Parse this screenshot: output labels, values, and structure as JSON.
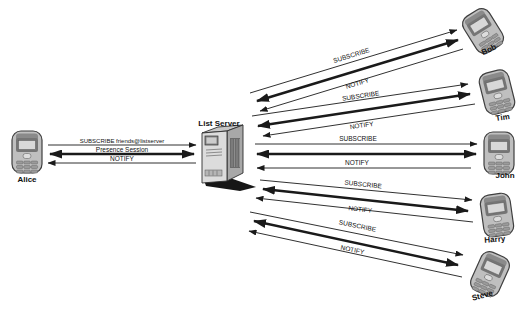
{
  "diagram": {
    "background": "#ffffff",
    "line_color": "#1a1a1a",
    "nodes": {
      "alice": {
        "label": "Alice"
      },
      "server": {
        "label": "List Server"
      },
      "bob": {
        "label": "Bob"
      },
      "tim": {
        "label": "Tim"
      },
      "john": {
        "label": "John"
      },
      "harry": {
        "label": "Harry"
      },
      "steve": {
        "label": "Steve"
      }
    },
    "links": {
      "alice": {
        "subscribe": "SUBSCRIBE friends@listserver",
        "session": "Presence Session",
        "notify": "NOTIFY"
      },
      "bob": {
        "subscribe": "SUBSCRIBE",
        "notify": "NOTIFY"
      },
      "tim": {
        "subscribe": "SUBSCRIBE",
        "notify": "NOTIFY"
      },
      "john": {
        "subscribe": "SUBSCRIBE",
        "notify": "NOTIFY"
      },
      "harry": {
        "subscribe": "SUBSCRIBE",
        "notify": "NOTIFY"
      },
      "steve": {
        "subscribe": "SUBSCRIBE",
        "notify": "NOTIFY"
      }
    }
  }
}
